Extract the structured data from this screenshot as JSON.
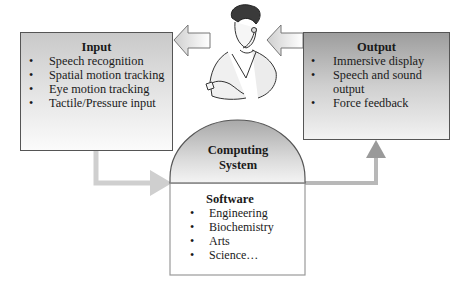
{
  "input": {
    "title": "Input",
    "items": [
      "Speech recognition",
      "Spatial motion tracking",
      "Eye motion tracking",
      "Tactile/Pressure input"
    ]
  },
  "output": {
    "title": "Output",
    "items": [
      "Immersive display",
      "Speech and sound output",
      "Force feedback"
    ]
  },
  "computing": {
    "title_line1": "Computing",
    "title_line2": "System",
    "software": {
      "title": "Software",
      "items": [
        "Engineering",
        "Biochemistry",
        "Arts",
        "Science…"
      ]
    }
  },
  "icons": {
    "user": "person-with-headset-icon",
    "arrow_to_input": "left-arrow-icon",
    "arrow_to_user": "left-arrow-icon"
  },
  "colors": {
    "border": "#555555",
    "connector": "#bdbdbd",
    "output_arrow": "#9a9a9a"
  }
}
